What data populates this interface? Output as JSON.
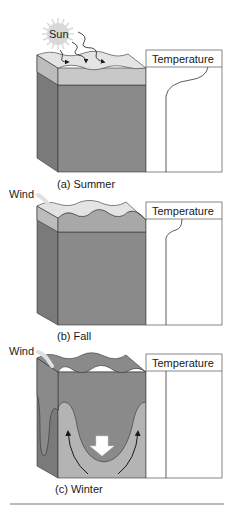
{
  "figure": {
    "panels": [
      {
        "id": "summer",
        "caption": "(a)  Summer",
        "sun_label": "Sun",
        "graph_label": "Temperature"
      },
      {
        "id": "fall",
        "caption": "(b)  Fall",
        "wind_label": "Wind",
        "graph_label": "Temperature"
      },
      {
        "id": "winter",
        "caption": "(c)  Winter",
        "wind_label": "Wind",
        "graph_label": "Temperature"
      }
    ]
  },
  "colors": {
    "deep_water": "#8a8a8a",
    "deep_side": "#7a7a7a",
    "warm_layer": "#c8c8c8",
    "surface_top": "#e4e4e4",
    "winter_light": "#b4b4b4",
    "outline": "#333333",
    "sun": "#d8d8d8"
  }
}
